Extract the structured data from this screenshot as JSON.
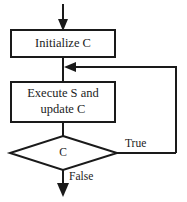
{
  "diagram": {
    "stroke_color": "#1a1a1a",
    "fill_color": "#ffffff",
    "text_color": "#1c1c1c",
    "nodes": {
      "initialize": {
        "label": "Initialize C",
        "shape": "rectangle"
      },
      "body": {
        "label_line1": "Execute S and",
        "label_line2": "update C",
        "shape": "rectangle"
      },
      "condition": {
        "label": "C",
        "shape": "diamond"
      }
    },
    "edges": {
      "entry": {
        "label": ""
      },
      "init_to_body": {
        "label": ""
      },
      "body_to_condition": {
        "label": ""
      },
      "condition_true": {
        "label": "True"
      },
      "condition_false": {
        "label": "False"
      },
      "loop_back": {
        "label": ""
      }
    }
  }
}
